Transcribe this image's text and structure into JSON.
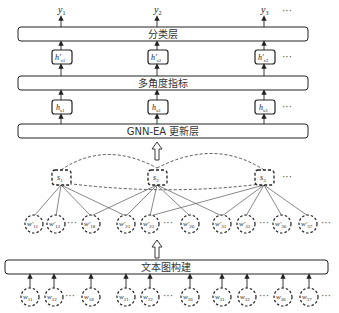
{
  "diagram": {
    "outputs": [
      {
        "var": "y",
        "sub": "1"
      },
      {
        "var": "y",
        "sub": "2"
      },
      {
        "var": "y",
        "sub": "3"
      }
    ],
    "ellipsis": "···",
    "layers": {
      "classification": "分类层",
      "multi_angle": "多角度指标",
      "gnn_update": "GNN-EA 更新层",
      "text_graph": "文本图构建"
    },
    "h_prime_nodes": [
      {
        "var": "h′",
        "sub": "s1"
      },
      {
        "var": "h′",
        "sub": "s2"
      },
      {
        "var": "h′",
        "sub": "s3"
      }
    ],
    "h_nodes": [
      {
        "var": "h",
        "sub": "s1"
      },
      {
        "var": "h",
        "sub": "s2"
      },
      {
        "var": "h",
        "sub": "s3"
      }
    ],
    "sentence_nodes": [
      {
        "var": "s",
        "sub": "1"
      },
      {
        "var": "s",
        "sub": "2"
      },
      {
        "var": "s",
        "sub": "3"
      }
    ],
    "word_prime_nodes": [
      {
        "var": "w′",
        "sub": "11"
      },
      {
        "var": "w′",
        "sub": "12"
      },
      {
        "var": "w′",
        "sub": "18"
      },
      {
        "var": "w′",
        "sub": "21"
      },
      {
        "var": "w′",
        "sub": "22"
      },
      {
        "var": "w′",
        "sub": "26"
      },
      {
        "var": "w′",
        "sub": "31"
      },
      {
        "var": "w′",
        "sub": "32"
      },
      {
        "var": "w′",
        "sub": "36"
      },
      {
        "var": "w′",
        "sub": "37"
      }
    ],
    "word_nodes": [
      {
        "var": "w",
        "sub": "11"
      },
      {
        "var": "w",
        "sub": "12"
      },
      {
        "var": "w",
        "sub": "18"
      },
      {
        "var": "w",
        "sub": "21"
      },
      {
        "var": "w",
        "sub": "22"
      },
      {
        "var": "w",
        "sub": "26"
      },
      {
        "var": "w",
        "sub": "31"
      },
      {
        "var": "w",
        "sub": "32"
      },
      {
        "var": "w",
        "sub": "36"
      },
      {
        "var": "w",
        "sub": "37"
      }
    ]
  }
}
